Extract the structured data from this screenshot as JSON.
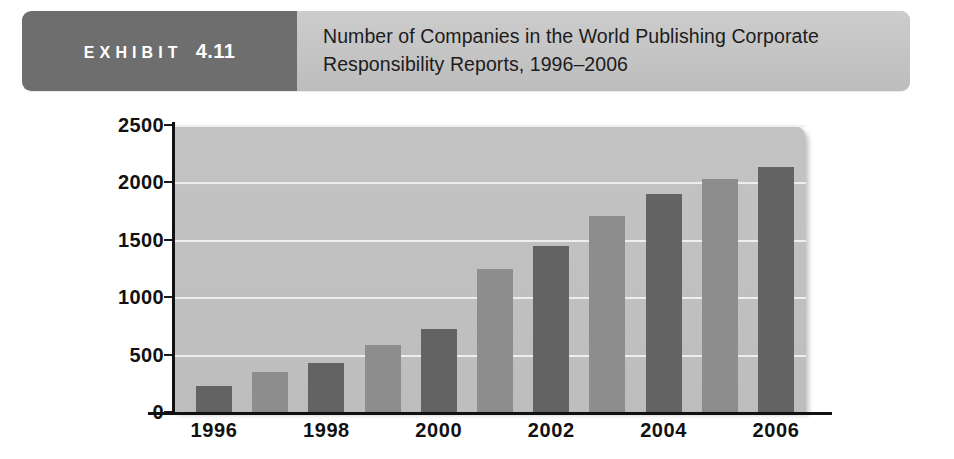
{
  "exhibit": {
    "label_word": "EXHIBIT",
    "label_number": "4.11",
    "title": "Number of Companies in the World Publishing Corporate Responsibility Reports, 1996–2006"
  },
  "colors": {
    "tag_background": "#6e6e6e",
    "header_background": "#c6c6c6",
    "plot_background": "#c1c1c1",
    "bar_dark": "#636363",
    "bar_light": "#8d8d8d",
    "gridline": "#f2f2f2",
    "axis": "#111111",
    "text": "#1c1c1c"
  },
  "chart_data": {
    "type": "bar",
    "title": "Number of Companies in the World Publishing Corporate Responsibility Reports, 1996–2006",
    "xlabel": "",
    "ylabel": "",
    "ylim": [
      0,
      2500
    ],
    "ytick_values": [
      0,
      500,
      1000,
      1500,
      2000,
      2500
    ],
    "ytick_labels": [
      "0",
      "500",
      "1000",
      "1500",
      "2000",
      "2500"
    ],
    "grid": true,
    "gridlines_at": [
      500,
      1000,
      1500,
      2000,
      2500
    ],
    "legend": null,
    "categories": [
      "1996",
      "1997",
      "1998",
      "1999",
      "2000",
      "2001",
      "2002",
      "2003",
      "2004",
      "2005",
      "2006"
    ],
    "xtick_labels_shown": [
      "1996",
      "1998",
      "2000",
      "2002",
      "2004",
      "2006"
    ],
    "values": [
      230,
      350,
      430,
      580,
      720,
      1250,
      1450,
      1710,
      1900,
      2030,
      2130
    ],
    "bars": [
      {
        "category": "1996",
        "value": 230,
        "shade": "dark"
      },
      {
        "category": "1997",
        "value": 350,
        "shade": "light"
      },
      {
        "category": "1998",
        "value": 430,
        "shade": "dark"
      },
      {
        "category": "1999",
        "value": 580,
        "shade": "light"
      },
      {
        "category": "2000",
        "value": 720,
        "shade": "dark"
      },
      {
        "category": "2001",
        "value": 1250,
        "shade": "light"
      },
      {
        "category": "2002",
        "value": 1450,
        "shade": "dark"
      },
      {
        "category": "2003",
        "value": 1710,
        "shade": "light"
      },
      {
        "category": "2004",
        "value": 1900,
        "shade": "dark"
      },
      {
        "category": "2005",
        "value": 2030,
        "shade": "light"
      },
      {
        "category": "2006",
        "value": 2130,
        "shade": "dark"
      }
    ]
  }
}
